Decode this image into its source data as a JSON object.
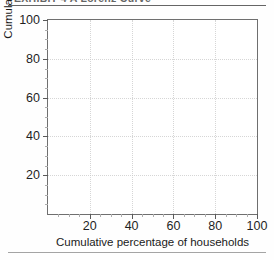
{
  "figure": {
    "caption_clipped": "EXHIBIT 4  A Lorenz Curve",
    "has_top_rule": true,
    "has_bottom_rule": true
  },
  "chart_data": {
    "type": "line",
    "title": "",
    "subtitle": "",
    "xlabel": "Cumulative percentage of households",
    "ylabel": "Cumulative percentage of income",
    "xlim": [
      0,
      100
    ],
    "ylim": [
      0,
      100
    ],
    "xticks": [
      20,
      40,
      60,
      80,
      100
    ],
    "yticks": [
      20,
      40,
      60,
      80,
      100
    ],
    "xticklabels": [
      "20",
      "40",
      "60",
      "80",
      "100"
    ],
    "yticklabels": [
      "20",
      "40",
      "60",
      "80",
      "100"
    ],
    "minor_tick_step": 5,
    "grid": true,
    "grid_style": "dotted",
    "grid_color": "#c9c9c9",
    "frame_color": "#6f6f6f",
    "legend": null,
    "legend_position": "none",
    "series": [],
    "annotations": [],
    "note": "Blank plotting grid — no data series is drawn inside the axes."
  }
}
